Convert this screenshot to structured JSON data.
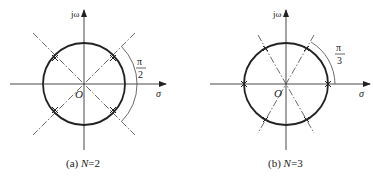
{
  "figure": {
    "panels": [
      {
        "id": "a",
        "caption_prefix": "(a) ",
        "caption_var": "N",
        "caption_suffix": "=2",
        "y_axis_label": "jω",
        "x_axis_label": "σ",
        "origin_label": "O",
        "angle_numerator": "π",
        "angle_denominator": "2",
        "pole_count": 4,
        "pole_angles_deg": [
          45,
          135,
          225,
          315
        ]
      },
      {
        "id": "b",
        "caption_prefix": "(b) ",
        "caption_var": "N",
        "caption_suffix": "=3",
        "y_axis_label": "jω",
        "x_axis_label": "σ",
        "origin_label": "O",
        "angle_numerator": "π",
        "angle_denominator": "3",
        "pole_count": 6,
        "pole_angles_deg": [
          0,
          60,
          120,
          180,
          240,
          300
        ]
      }
    ]
  }
}
